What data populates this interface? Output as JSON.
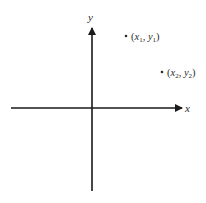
{
  "diagram": {
    "type": "cartesian-plane",
    "axes": {
      "x_label": "x",
      "y_label": "y"
    },
    "points": [
      {
        "name": "x1y1",
        "x_sym": "x",
        "x_sub": "1",
        "y_sym": "y",
        "y_sub": "1"
      },
      {
        "name": "x2y2",
        "x_sym": "x",
        "x_sub": "2",
        "y_sym": "y",
        "y_sub": "2"
      }
    ],
    "punct": {
      "open": "(",
      "comma": ", ",
      "close": ")"
    },
    "colors": {
      "axis": "#1a1a1a",
      "text": "#2b2b2b",
      "background": "#ffffff"
    }
  }
}
